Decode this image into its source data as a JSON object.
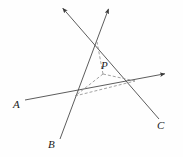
{
  "figure": {
    "background_color": "#fefefe",
    "stroke_color": "#4a4a4a",
    "label_color": "#1a1a1a",
    "dashed_color": "#8a8a8a",
    "stroke_width": 0.9,
    "dash_pattern": "3,2"
  },
  "labels": {
    "A": "A",
    "B": "B",
    "C": "C",
    "P": "P"
  },
  "geometry": {
    "rays": [
      {
        "name": "ray-A",
        "label": "A",
        "from": {
          "x": 25,
          "y": 100
        },
        "to": {
          "x": 169,
          "y": 73
        },
        "arrow_at": "end",
        "style": "solid"
      },
      {
        "name": "ray-B",
        "label": "B",
        "from": {
          "x": 60,
          "y": 139
        },
        "to": {
          "x": 110,
          "y": 5
        },
        "arrow_at": "end",
        "style": "solid"
      },
      {
        "name": "ray-C",
        "label": "C",
        "from": {
          "x": 159,
          "y": 119
        },
        "to": {
          "x": 60,
          "y": 5
        },
        "arrow_at": "end",
        "style": "solid"
      }
    ],
    "vertices": [
      {
        "name": "vertex-left",
        "x": 75,
        "y": 96,
        "of": "ray-A x ray-B"
      },
      {
        "name": "vertex-right",
        "x": 135,
        "y": 81,
        "of": "ray-A x ray-C"
      },
      {
        "name": "vertex-top",
        "x": 97,
        "y": 42,
        "of": "ray-B x ray-C"
      }
    ],
    "interior_point": {
      "name": "P",
      "x": 103,
      "y": 74
    },
    "dashed_segments": [
      {
        "name": "triangle-base",
        "from": {
          "x": 75,
          "y": 96
        },
        "to": {
          "x": 135,
          "y": 81
        }
      },
      {
        "name": "cevian-to-left",
        "from": {
          "x": 103,
          "y": 74
        },
        "to": {
          "x": 75,
          "y": 96
        }
      },
      {
        "name": "cevian-to-right",
        "from": {
          "x": 103,
          "y": 74
        },
        "to": {
          "x": 135,
          "y": 81
        }
      },
      {
        "name": "cevian-to-top",
        "from": {
          "x": 103,
          "y": 74
        },
        "to": {
          "x": 97,
          "y": 42
        }
      }
    ]
  }
}
